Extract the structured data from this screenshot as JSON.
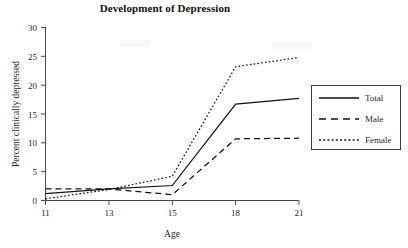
{
  "chart_data": {
    "type": "line",
    "title": "Development of Depression",
    "xlabel": "Age",
    "ylabel": "Percent clinically depressed",
    "x": [
      11,
      13,
      15,
      18,
      21
    ],
    "categories": [
      "11",
      "13",
      "15",
      "18",
      "21"
    ],
    "xtick_labels": [
      "11",
      "13",
      "15",
      "18",
      "21"
    ],
    "ytick_labels": [
      "0",
      "5",
      "10",
      "15",
      "20",
      "25",
      "30"
    ],
    "yticks": [
      0,
      5,
      10,
      15,
      20,
      25,
      30
    ],
    "xlim": [
      11,
      21
    ],
    "ylim": [
      0,
      30
    ],
    "grid": false,
    "legend_position": "right",
    "series": [
      {
        "name": "Total",
        "style": "solid",
        "color": "#111111",
        "values": [
          1.2,
          2.0,
          2.6,
          16.7,
          17.7
        ]
      },
      {
        "name": "Male",
        "style": "dashed",
        "color": "#111111",
        "values": [
          2.0,
          2.0,
          1.0,
          10.7,
          10.8
        ]
      },
      {
        "name": "Female",
        "style": "dotted",
        "color": "#111111",
        "values": [
          0.3,
          1.9,
          4.2,
          23.2,
          24.8
        ]
      }
    ]
  },
  "legend": {
    "entries": [
      {
        "label": "Total",
        "swatch": "solid-line-swatch"
      },
      {
        "label": "Male",
        "swatch": "dashed-line-swatch"
      },
      {
        "label": "Female",
        "swatch": "dotted-line-swatch"
      }
    ]
  }
}
